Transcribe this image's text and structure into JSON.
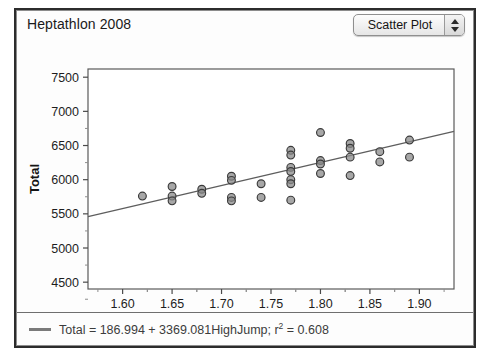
{
  "window": {
    "title": "Heptathlon 2008",
    "dropdown": {
      "value": "Scatter Plot",
      "up_icon": "stepper-up-icon",
      "down_icon": "stepper-down-icon"
    }
  },
  "legend": {
    "swatch": "regression-line-swatch",
    "prefix": "Total = 186.994 + 3369.081HighJump; r",
    "exponent": "2",
    "suffix": " = 0.608"
  },
  "chart_data": {
    "type": "scatter",
    "title": "Heptathlon 2008",
    "xlabel": "HighJump",
    "ylabel": "Total",
    "xlim": [
      1.565,
      1.935
    ],
    "ylim": [
      4400,
      7620
    ],
    "xticks": [
      1.6,
      1.65,
      1.7,
      1.75,
      1.8,
      1.85,
      1.9
    ],
    "xtick_labels": [
      "1.60",
      "1.65",
      "1.70",
      "1.75",
      "1.80",
      "1.85",
      "1.90"
    ],
    "yticks": [
      4500,
      5000,
      5500,
      6000,
      6500,
      7000,
      7500
    ],
    "ytick_labels": [
      "4500",
      "5000",
      "5500",
      "6000",
      "6500",
      "7000",
      "7500"
    ],
    "grid": false,
    "legend_position": "bottom",
    "marker": {
      "shape": "circle",
      "fill": "#8a8a8a",
      "edge": "#3a3a3a",
      "size": 5
    },
    "fit": {
      "type": "linear",
      "intercept": 186.994,
      "slope": 3369.081,
      "r_squared": 0.608,
      "color": "#5e5e5e",
      "label": "Total = 186.994 + 3369.081HighJump; r2 = 0.608"
    },
    "points": [
      {
        "x": 1.62,
        "y": 5760
      },
      {
        "x": 1.65,
        "y": 5900
      },
      {
        "x": 1.65,
        "y": 5760
      },
      {
        "x": 1.65,
        "y": 5690
      },
      {
        "x": 1.68,
        "y": 5860
      },
      {
        "x": 1.68,
        "y": 5800
      },
      {
        "x": 1.71,
        "y": 6050
      },
      {
        "x": 1.71,
        "y": 5990
      },
      {
        "x": 1.71,
        "y": 5740
      },
      {
        "x": 1.71,
        "y": 5690
      },
      {
        "x": 1.74,
        "y": 5940
      },
      {
        "x": 1.74,
        "y": 5740
      },
      {
        "x": 1.77,
        "y": 6430
      },
      {
        "x": 1.77,
        "y": 6360
      },
      {
        "x": 1.77,
        "y": 6180
      },
      {
        "x": 1.77,
        "y": 6120
      },
      {
        "x": 1.77,
        "y": 6000
      },
      {
        "x": 1.77,
        "y": 5940
      },
      {
        "x": 1.77,
        "y": 5700
      },
      {
        "x": 1.8,
        "y": 6690
      },
      {
        "x": 1.8,
        "y": 6280
      },
      {
        "x": 1.8,
        "y": 6230
      },
      {
        "x": 1.8,
        "y": 6090
      },
      {
        "x": 1.83,
        "y": 6530
      },
      {
        "x": 1.83,
        "y": 6460
      },
      {
        "x": 1.83,
        "y": 6330
      },
      {
        "x": 1.83,
        "y": 6060
      },
      {
        "x": 1.86,
        "y": 6410
      },
      {
        "x": 1.86,
        "y": 6260
      },
      {
        "x": 1.89,
        "y": 6580
      },
      {
        "x": 1.89,
        "y": 6330
      }
    ]
  }
}
